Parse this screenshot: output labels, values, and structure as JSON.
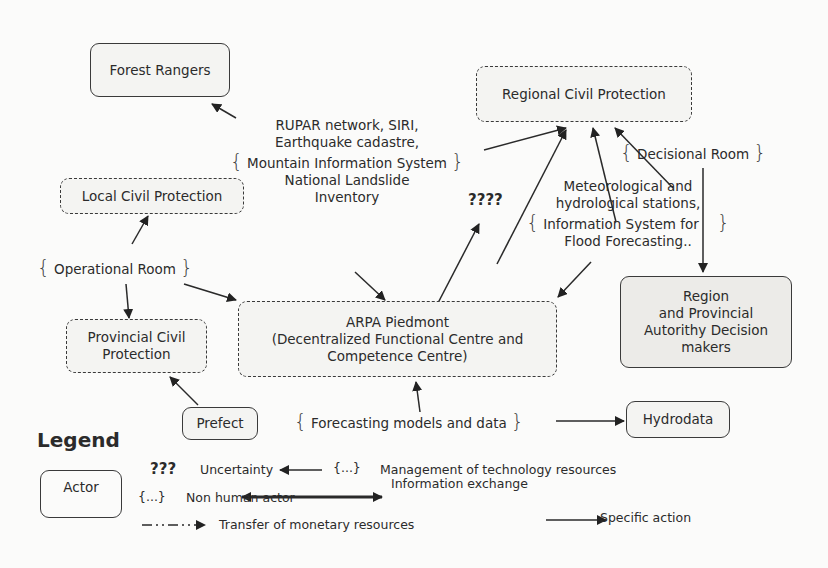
{
  "actors": {
    "forest_rangers": "Forest Rangers",
    "regional_civil_protection": "Regional Civil Protection",
    "local_civil_protection": "Local Civil Protection",
    "provincial_civil_protection_l1": "Provincial Civil",
    "provincial_civil_protection_l2": "Protection",
    "arpa_l1": "ARPA Piedmont",
    "arpa_l2": "(Decentralized Functional Centre and",
    "arpa_l3": "Competence Centre)",
    "region_l1": "Region",
    "region_l2": "and Provincial",
    "region_l3": "Autorithy Decision",
    "region_l4": "makers",
    "prefect": "Prefect",
    "hydrodata": "Hydrodata"
  },
  "resources": {
    "rupar_l1": "RUPAR network, SIRI,",
    "rupar_l2": "Earthquake cadastre,",
    "rupar_l3": "Mountain Information System",
    "rupar_l4": "National Landslide",
    "rupar_l5": "Inventory",
    "decisional_room": "Decisional Room",
    "operational_room": "Operational Room",
    "meteo_l1": "Meteorological and",
    "meteo_l2": "hydrological stations,",
    "meteo_l3": "Information System for",
    "meteo_l4": "Flood Forecasting..",
    "forecasting": "Forecasting  models and data",
    "uncertainty_mark": "????"
  },
  "legend": {
    "title": "Legend",
    "actor": "Actor",
    "uncertainty_symbol": "???",
    "uncertainty": "Uncertainty",
    "tech_symbol": "{...}",
    "tech": "Management of technology resources",
    "nonhuman_symbol": "{...}",
    "nonhuman": "Non human actor",
    "info_exchange": "Information exchange",
    "monetary": "Transfer of monetary resources",
    "specific_action": "Specific action"
  },
  "braces": {
    "open": "{",
    "close": "}"
  }
}
